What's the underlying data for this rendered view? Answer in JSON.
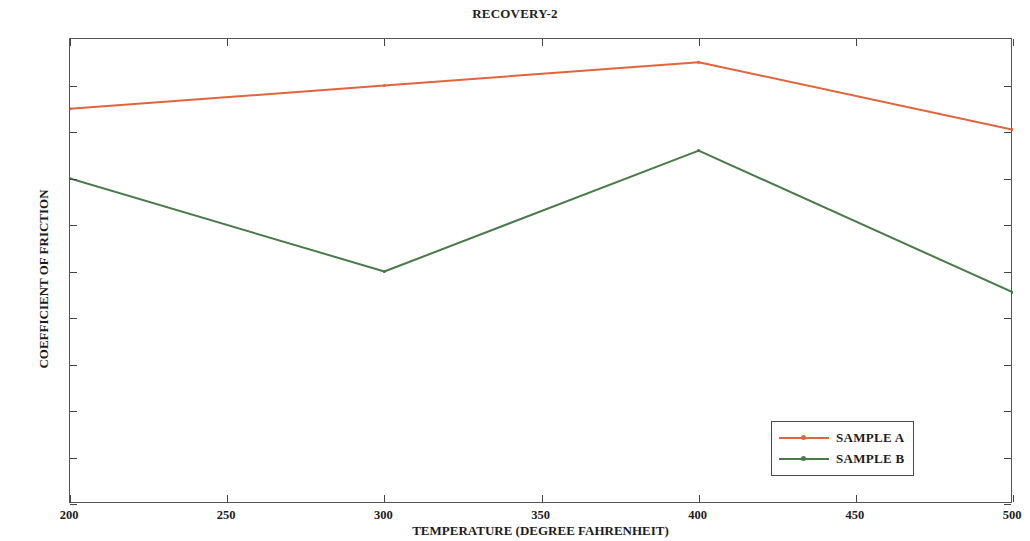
{
  "figure": {
    "title": "RECOVERY-2"
  },
  "chart_data": {
    "type": "line",
    "title": "RECOVERY-2",
    "xlabel": "TEMPERATURE (DEGREE FAHRENHEIT)",
    "ylabel": "COEFFICIENT OF FRICTION",
    "x": [
      200,
      300,
      400,
      500
    ],
    "xlim": [
      200,
      500
    ],
    "ylim": [
      0.4,
      0.6
    ],
    "xticks": [
      200,
      250,
      300,
      350,
      400,
      450,
      500
    ],
    "xtick_labels": [
      "200",
      "250",
      "300",
      "350",
      "400",
      "450",
      "500"
    ],
    "yticks": [
      0.4,
      0.42,
      0.44,
      0.46,
      0.48,
      0.5,
      0.52,
      0.54,
      0.56,
      0.58
    ],
    "ytick_labels": [
      "0.4",
      "0.42",
      "0.44",
      "0.46",
      "0.48",
      "0.5",
      "0.52",
      "0.54",
      "0.56",
      "0.58"
    ],
    "grid": false,
    "legend_position": "lower right",
    "series": [
      {
        "name": "SAMPLE A",
        "color": "#e2643c",
        "values": [
          0.57,
          0.58,
          0.59,
          0.561
        ]
      },
      {
        "name": "SAMPLE B",
        "color": "#4a7a4a",
        "values": [
          0.54,
          0.5,
          0.552,
          0.491
        ]
      }
    ]
  },
  "legend": {
    "items": [
      {
        "label": "SAMPLE A",
        "color": "#e2643c"
      },
      {
        "label": "SAMPLE B",
        "color": "#4a7a4a"
      }
    ]
  }
}
